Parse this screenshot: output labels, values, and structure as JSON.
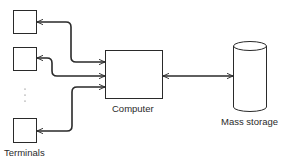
{
  "diagram": {
    "type": "block-diagram",
    "colors": {
      "stroke": "#2a2a2a",
      "background": "#ffffff"
    },
    "nodes": {
      "terminal_1": {
        "shape": "square"
      },
      "terminal_2": {
        "shape": "square"
      },
      "terminal_ellipsis": {
        "text": "⋮"
      },
      "terminal_3": {
        "shape": "square"
      },
      "computer": {
        "shape": "rectangle",
        "label": "Computer"
      },
      "mass_storage": {
        "shape": "cylinder",
        "label": "Mass storage"
      }
    },
    "group_labels": {
      "terminals": "Terminals"
    },
    "edges": [
      {
        "from": "terminal_1",
        "to": "computer",
        "direction": "bidirectional"
      },
      {
        "from": "terminal_2",
        "to": "computer",
        "direction": "bidirectional"
      },
      {
        "from": "terminal_3",
        "to": "computer",
        "direction": "bidirectional"
      },
      {
        "from": "computer",
        "to": "mass_storage",
        "direction": "bidirectional"
      }
    ]
  }
}
